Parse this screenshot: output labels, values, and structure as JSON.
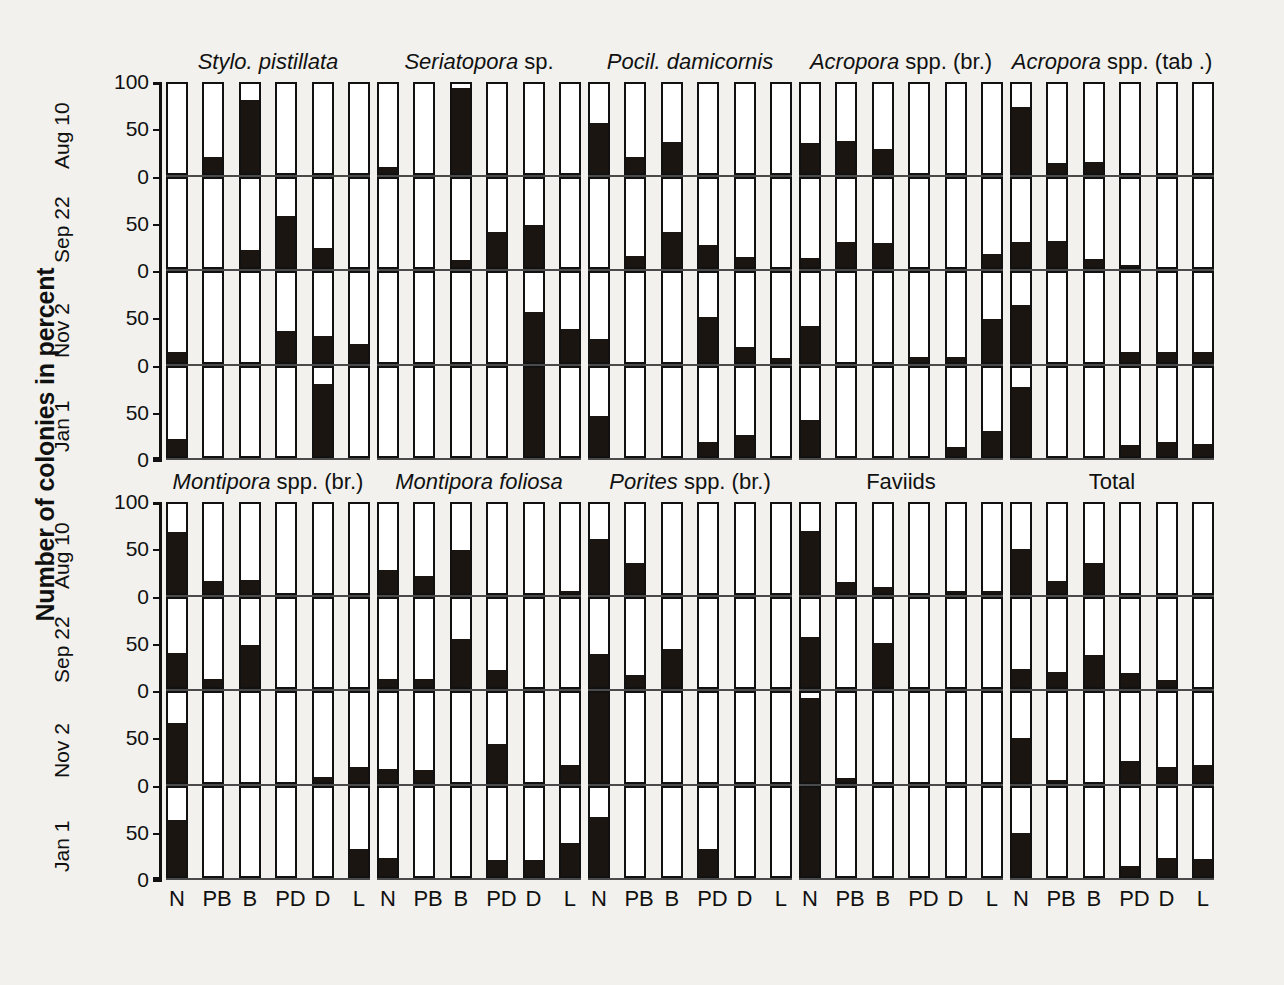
{
  "figure": {
    "ylabel": "Number of colonies in percent",
    "date_labels": [
      "Aug 10",
      "Sep 22",
      "Nov 2",
      "Jan 1"
    ],
    "y_ticks": [
      "100",
      "50",
      "0"
    ],
    "categories": [
      "N",
      "PB",
      "B",
      "PD",
      "D",
      "L"
    ],
    "ink": "#1a1511"
  },
  "chart_data": {
    "type": "bar",
    "title": "Number of colonies in percent",
    "xlabel": "",
    "ylabel": "Number of colonies in percent",
    "ylim": [
      0,
      100
    ],
    "grid": true,
    "legend": "none",
    "categories": [
      "N",
      "PB",
      "B",
      "PD",
      "D",
      "L"
    ],
    "row_groups": [
      "Aug 10",
      "Sep 22",
      "Nov 2",
      "Jan 1"
    ],
    "category_meanings": {
      "N": "Normal",
      "PB": "Partly bleached",
      "B": "Bleached",
      "PD": "Partly dead",
      "D": "Dead",
      "L": "Lost"
    },
    "panels": [
      {
        "title_italic": "Stylo. pistillata",
        "title_plain": "",
        "series": [
          {
            "name": "Aug 10",
            "values": [
              0,
              18,
              82,
              0,
              0,
              0
            ]
          },
          {
            "name": "Sep 22",
            "values": [
              0,
              0,
              19,
              58,
              21,
              0
            ]
          },
          {
            "name": "Nov 2",
            "values": [
              11,
              0,
              0,
              35,
              29,
              20
            ]
          },
          {
            "name": "Jan 1",
            "values": [
              19,
              0,
              0,
              0,
              81,
              0
            ]
          }
        ]
      },
      {
        "title_italic": "Seriatopora",
        "title_plain": " sp.",
        "series": [
          {
            "name": "Aug 10",
            "values": [
              6,
              0,
              95,
              0,
              0,
              0
            ]
          },
          {
            "name": "Sep 22",
            "values": [
              0,
              0,
              8,
              40,
              48,
              0
            ]
          },
          {
            "name": "Nov 2",
            "values": [
              0,
              0,
              0,
              0,
              56,
              37
            ]
          },
          {
            "name": "Jan 1",
            "values": [
              0,
              0,
              0,
              0,
              100,
              0
            ]
          }
        ]
      },
      {
        "title_italic": "Pocil. damicornis",
        "title_plain": "",
        "series": [
          {
            "name": "Aug 10",
            "values": [
              56,
              18,
              35,
              0,
              0,
              0
            ]
          },
          {
            "name": "Sep 22",
            "values": [
              0,
              13,
              40,
              25,
              11,
              0
            ]
          },
          {
            "name": "Nov 2",
            "values": [
              26,
              0,
              0,
              50,
              16,
              4
            ]
          },
          {
            "name": "Jan 1",
            "values": [
              45,
              0,
              0,
              16,
              24,
              0
            ]
          }
        ]
      },
      {
        "title_italic": "Acropora",
        "title_plain": " spp. (br.)",
        "series": [
          {
            "name": "Aug 10",
            "values": [
              33,
              36,
              27,
              0,
              0,
              0
            ]
          },
          {
            "name": "Sep 22",
            "values": [
              10,
              28,
              27,
              0,
              0,
              15
            ]
          },
          {
            "name": "Nov 2",
            "values": [
              40,
              0,
              0,
              5,
              5,
              48
            ]
          },
          {
            "name": "Jan 1",
            "values": [
              41,
              0,
              0,
              0,
              10,
              28
            ]
          }
        ]
      },
      {
        "title_italic": "Acropora",
        "title_plain": " spp. (tab .)",
        "series": [
          {
            "name": "Aug 10",
            "values": [
              74,
              11,
              12,
              0,
              0,
              0
            ]
          },
          {
            "name": "Sep 22",
            "values": [
              28,
              29,
              9,
              2,
              0,
              0
            ]
          },
          {
            "name": "Nov 2",
            "values": [
              64,
              0,
              0,
              11,
              11,
              11
            ]
          },
          {
            "name": "Jan 1",
            "values": [
              78,
              0,
              0,
              13,
              16,
              14
            ]
          }
        ]
      },
      {
        "title_italic": "Montipora",
        "title_plain": " spp. (br.)",
        "series": [
          {
            "name": "Aug 10",
            "values": [
              68,
              13,
              14,
              0,
              0,
              0
            ]
          },
          {
            "name": "Sep 22",
            "values": [
              39,
              9,
              48,
              0,
              0,
              0
            ]
          },
          {
            "name": "Nov 2",
            "values": [
              66,
              0,
              0,
              0,
              5,
              16
            ]
          },
          {
            "name": "Jan 1",
            "values": [
              63,
              0,
              0,
              0,
              0,
              30
            ]
          }
        ]
      },
      {
        "title_italic": "Montipora foliosa",
        "title_plain": "",
        "series": [
          {
            "name": "Aug 10",
            "values": [
              25,
              19,
              48,
              0,
              0,
              2
            ]
          },
          {
            "name": "Sep 22",
            "values": [
              9,
              9,
              54,
              19,
              0,
              0
            ]
          },
          {
            "name": "Nov 2",
            "values": [
              14,
              13,
              0,
              42,
              0,
              19
            ]
          },
          {
            "name": "Jan 1",
            "values": [
              20,
              0,
              0,
              18,
              18,
              37
            ]
          }
        ]
      },
      {
        "title_italic": "Porites",
        "title_plain": " spp. (br.)",
        "series": [
          {
            "name": "Aug 10",
            "values": [
              61,
              33,
              0,
              0,
              0,
              0
            ]
          },
          {
            "name": "Sep 22",
            "values": [
              37,
              14,
              43,
              0,
              0,
              0
            ]
          },
          {
            "name": "Nov 2",
            "values": [
              100,
              0,
              0,
              0,
              0,
              0
            ]
          },
          {
            "name": "Jan 1",
            "values": [
              67,
              0,
              0,
              30,
              0,
              0
            ]
          }
        ]
      },
      {
        "title_italic": "",
        "title_plain": "Faviids",
        "series": [
          {
            "name": "Aug 10",
            "values": [
              70,
              12,
              6,
              0,
              2,
              2
            ]
          },
          {
            "name": "Sep 22",
            "values": [
              56,
              0,
              50,
              0,
              0,
              0
            ]
          },
          {
            "name": "Nov 2",
            "values": [
              94,
              4,
              0,
              0,
              0,
              0
            ]
          },
          {
            "name": "Jan 1",
            "values": [
              100,
              0,
              0,
              0,
              0,
              0
            ]
          }
        ]
      },
      {
        "title_italic": "",
        "title_plain": "Total",
        "series": [
          {
            "name": "Aug 10",
            "values": [
              49,
              13,
              33,
              0,
              0,
              0
            ]
          },
          {
            "name": "Sep 22",
            "values": [
              20,
              17,
              36,
              16,
              8,
              0
            ]
          },
          {
            "name": "Nov 2",
            "values": [
              49,
              2,
              0,
              23,
              16,
              19
            ]
          },
          {
            "name": "Jan 1",
            "values": [
              49,
              0,
              0,
              11,
              20,
              19
            ]
          }
        ]
      }
    ]
  }
}
